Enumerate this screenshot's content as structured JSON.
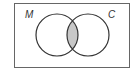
{
  "diagram": {
    "type": "venn",
    "sets": [
      {
        "label": "M",
        "cx": 57,
        "cy": 35,
        "r": 21
      },
      {
        "label": "C",
        "cx": 88,
        "cy": 35,
        "r": 21
      }
    ],
    "shaded_region": "intersection",
    "colors": {
      "border": "#555555",
      "circle": "#333333",
      "shade": "#c8c8c8",
      "background": "#ffffff"
    }
  }
}
